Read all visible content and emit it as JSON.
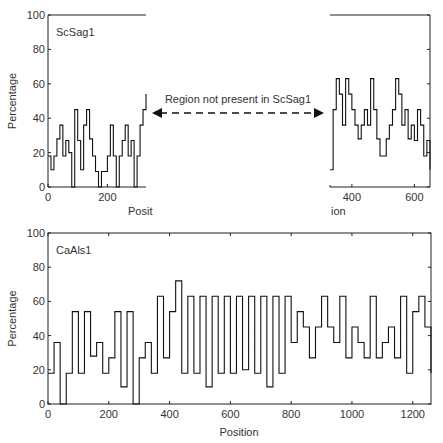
{
  "chart_data": [
    {
      "type": "line",
      "title": "ScSag1",
      "xlabel": "Position",
      "ylabel": "Percentage",
      "ylim": [
        0,
        100
      ],
      "yticks": [
        0,
        20,
        40,
        60,
        80,
        100
      ],
      "segments": [
        {
          "xlim": [
            0,
            330
          ],
          "xticks": [
            0,
            200
          ],
          "x": [
            0,
            10,
            20,
            30,
            40,
            50,
            60,
            70,
            80,
            90,
            100,
            110,
            120,
            130,
            140,
            150,
            160,
            170,
            180,
            190,
            200,
            210,
            220,
            230,
            240,
            250,
            260,
            270,
            280,
            290,
            300,
            310,
            320,
            330
          ],
          "y": [
            18,
            10,
            18,
            28,
            36,
            18,
            27,
            20,
            0,
            45,
            27,
            10,
            36,
            45,
            28,
            18,
            9,
            0,
            9,
            9,
            18,
            36,
            18,
            0,
            18,
            27,
            36,
            18,
            27,
            0,
            18,
            36,
            45,
            54
          ]
        },
        {
          "xlim": [
            330,
            650
          ],
          "xticks": [
            400,
            600
          ],
          "x": [
            330,
            340,
            350,
            360,
            370,
            380,
            390,
            400,
            410,
            420,
            430,
            440,
            450,
            460,
            470,
            480,
            490,
            500,
            510,
            520,
            530,
            540,
            550,
            560,
            570,
            580,
            590,
            600,
            610,
            620,
            630,
            640,
            650
          ],
          "y": [
            10,
            45,
            63,
            54,
            36,
            63,
            54,
            45,
            36,
            28,
            36,
            45,
            36,
            63,
            45,
            28,
            18,
            18,
            28,
            36,
            45,
            63,
            54,
            36,
            45,
            28,
            36,
            27,
            45,
            36,
            18,
            27,
            10
          ]
        }
      ],
      "annotation": "Region not present in ScSag1"
    },
    {
      "type": "line",
      "title": "CaAls1",
      "xlabel": "Position",
      "ylabel": "Percentage",
      "ylim": [
        0,
        100
      ],
      "xlim": [
        0,
        1260
      ],
      "xticks": [
        0,
        200,
        400,
        600,
        800,
        1000,
        1200
      ],
      "yticks": [
        0,
        20,
        40,
        60,
        80,
        100
      ],
      "x": [
        0,
        20,
        40,
        60,
        80,
        100,
        120,
        140,
        160,
        180,
        200,
        220,
        240,
        260,
        280,
        300,
        320,
        340,
        360,
        380,
        400,
        420,
        440,
        460,
        480,
        500,
        520,
        540,
        560,
        580,
        600,
        620,
        640,
        660,
        680,
        700,
        720,
        740,
        760,
        780,
        800,
        820,
        840,
        860,
        880,
        900,
        920,
        940,
        960,
        980,
        1000,
        1020,
        1040,
        1060,
        1080,
        1100,
        1120,
        1140,
        1160,
        1180,
        1200,
        1220,
        1240,
        1260
      ],
      "y": [
        18,
        36,
        0,
        18,
        54,
        18,
        54,
        28,
        36,
        18,
        27,
        54,
        10,
        54,
        0,
        27,
        36,
        18,
        63,
        27,
        54,
        72,
        18,
        63,
        18,
        63,
        10,
        63,
        18,
        63,
        18,
        63,
        20,
        63,
        18,
        63,
        10,
        63,
        18,
        63,
        36,
        54,
        45,
        27,
        45,
        63,
        45,
        36,
        63,
        27,
        45,
        36,
        27,
        63,
        27,
        36,
        45,
        27,
        63,
        18,
        54,
        63,
        45,
        18
      ]
    }
  ],
  "labels": {
    "top_title": "ScSag1",
    "bottom_title": "CaAls1",
    "ylabel": "Percentage",
    "xlabel_top_left": "Posit",
    "xlabel_top_right": "ion",
    "xlabel_bottom": "Position",
    "annotation": "Region not present in ScSag1"
  }
}
